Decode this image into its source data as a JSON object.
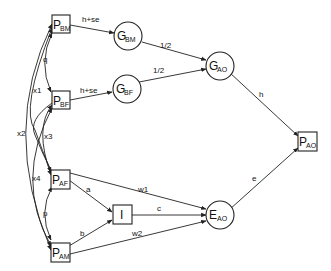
{
  "diagram": {
    "type": "path-diagram",
    "nodes": {
      "pbm": {
        "main": "P",
        "sub": "BM",
        "shape": "box"
      },
      "pbf": {
        "main": "P",
        "sub": "BF",
        "shape": "box"
      },
      "paf": {
        "main": "P",
        "sub": "AF",
        "shape": "box"
      },
      "pam": {
        "main": "P",
        "sub": "AM",
        "shape": "box"
      },
      "gbm": {
        "main": "G",
        "sub": "BM",
        "shape": "circle"
      },
      "gbf": {
        "main": "G",
        "sub": "BF",
        "shape": "circle"
      },
      "gao": {
        "main": "G",
        "sub": "AO",
        "shape": "circle"
      },
      "i": {
        "main": "I",
        "sub": "",
        "shape": "box"
      },
      "eao": {
        "main": "E",
        "sub": "AO",
        "shape": "circle"
      },
      "pao": {
        "main": "P",
        "sub": "AO",
        "shape": "box"
      }
    },
    "edges": {
      "pbm_gbm": "h+se",
      "pbf_gbf": "h+se",
      "gbm_gao": "1/2",
      "gbf_gao": "1/2",
      "gao_pao": "h",
      "eao_pao": "e",
      "paf_i": "a",
      "pam_i": "b",
      "i_eao": "c",
      "paf_eao": "w1",
      "pam_eao": "w2",
      "pbm_pbf": "q",
      "paf_pam": "p",
      "x1": "x1",
      "x2": "x2",
      "x3": "x3",
      "x4": "x4"
    }
  }
}
